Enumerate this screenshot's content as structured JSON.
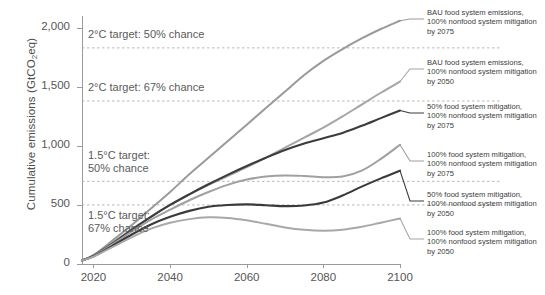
{
  "chart_data": {
    "type": "line",
    "title": "",
    "xlabel": "",
    "ylabel": "Cumulative emissions (GtCO2eq)",
    "ylabel_main": "Cumulative emissions (GtCO",
    "ylabel_sub": "2",
    "ylabel_tail": "eq)",
    "xlim": [
      2017,
      2100
    ],
    "ylim": [
      0,
      2100
    ],
    "grid": false,
    "legend_position": "right",
    "xticks": [
      2020,
      2040,
      2060,
      2080,
      2100
    ],
    "xtick_labels": [
      "2020",
      "2040",
      "2060",
      "2080",
      "2100"
    ],
    "yticks": [
      0,
      500,
      1000,
      1500,
      2000
    ],
    "ytick_labels": [
      "0",
      "500",
      "1,000",
      "1,500",
      "2,000"
    ],
    "x": [
      2017,
      2020,
      2025,
      2030,
      2035,
      2040,
      2045,
      2050,
      2055,
      2060,
      2065,
      2070,
      2075,
      2080,
      2085,
      2090,
      2095,
      2100
    ],
    "threshold_lines": [
      {
        "label": "2°C target: 50% chance",
        "value": 1830,
        "style": "dashed"
      },
      {
        "label": "2°C target: 67% chance",
        "value": 1380,
        "style": "dashed"
      },
      {
        "label": "1.5°C target:\n50% chance",
        "value": 700,
        "style": "dashed"
      },
      {
        "label": "1.5°C target:\n67% chance",
        "value": 500,
        "style": "dashed"
      }
    ],
    "series": [
      {
        "name": "BAU food system emissions, 100% nonfood system mitigation by 2075",
        "legend_line1": "BAU food system emissions,",
        "legend_line2": "100% nonfood system mitigation",
        "legend_line3": "by 2075",
        "color": "#9a9a9a",
        "width": 2.0,
        "values": [
          30,
          75,
          200,
          330,
          470,
          610,
          760,
          900,
          1040,
          1180,
          1320,
          1460,
          1600,
          1720,
          1820,
          1910,
          1990,
          2060
        ]
      },
      {
        "name": "BAU food system emissions, 100% nonfood system mitigation by 2050",
        "legend_line1": "BAU food system emissions,",
        "legend_line2": "100% nonfood system mitigation",
        "legend_line3": "by 2050",
        "color": "#a5a5a5",
        "width": 2.0,
        "values": [
          30,
          72,
          180,
          295,
          400,
          500,
          590,
          670,
          745,
          820,
          900,
          985,
          1070,
          1155,
          1250,
          1350,
          1450,
          1545
        ]
      },
      {
        "name": "50% food system mitigation, 100% nonfood system mitigation by 2075",
        "legend_line1": "50% food system mitigation,",
        "legend_line2": "100% nonfood system mitigation",
        "legend_line3": "by 2075",
        "color": "#3c3c3c",
        "width": 2.1,
        "values": [
          30,
          70,
          175,
          290,
          400,
          500,
          590,
          675,
          755,
          830,
          900,
          965,
          1020,
          1065,
          1110,
          1170,
          1235,
          1300
        ]
      },
      {
        "name": "100% food system mitigation, 100% nonfood system mitigation by 2075",
        "legend_line1": "100% food system mitigation,",
        "legend_line2": "100% nonfood system mitigation",
        "legend_line3": "by 2075",
        "color": "#a0a0a0",
        "width": 2.0,
        "values": [
          30,
          68,
          168,
          275,
          375,
          460,
          540,
          610,
          670,
          715,
          740,
          750,
          745,
          735,
          740,
          790,
          890,
          1010
        ]
      },
      {
        "name": "50% food system mitigation, 100% nonfood system mitigation by 2050",
        "legend_line1": "50% food system mitigation,",
        "legend_line2": "100% nonfood system mitigation",
        "legend_line3": "by 2050",
        "color": "#3a3a3a",
        "width": 2.1,
        "values": [
          30,
          65,
          155,
          250,
          335,
          400,
          450,
          485,
          500,
          505,
          498,
          490,
          495,
          520,
          580,
          655,
          725,
          790
        ]
      },
      {
        "name": "100% food system mitigation, 100% nonfood system mitigation by 2050",
        "legend_line1": "100% food system mitigation,",
        "legend_line2": "100% nonfood system mitigation",
        "legend_line3": "by 2050",
        "color": "#a8a8a8",
        "width": 2.0,
        "values": [
          30,
          62,
          145,
          228,
          300,
          350,
          380,
          395,
          390,
          370,
          340,
          310,
          290,
          282,
          290,
          315,
          350,
          385
        ]
      }
    ]
  }
}
